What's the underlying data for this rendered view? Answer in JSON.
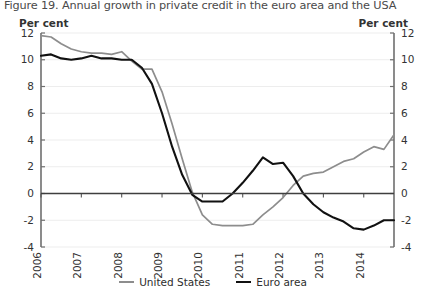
{
  "figure": {
    "title": "Figure 19. Annual growth in private credit in the euro area and the USA",
    "unit_left": "Per cent",
    "unit_right": "Per cent"
  },
  "legend": {
    "items": [
      {
        "label": "United States",
        "color": "#8d8d8d"
      },
      {
        "label": "Euro area",
        "color": "#111111"
      }
    ]
  },
  "chart_data": {
    "type": "line",
    "title": "Figure 19. Annual growth in private credit in the euro area and the USA",
    "xlabel": "",
    "ylabel": "Per cent",
    "ylabel_right": "Per cent",
    "xlim": [
      2006,
      2014.75
    ],
    "ylim": [
      -4,
      12
    ],
    "yticks": [
      -4,
      -2,
      0,
      2,
      4,
      6,
      8,
      10,
      12
    ],
    "ytick_labels": [
      "-4",
      "-2",
      "0",
      "2",
      "4",
      "6",
      "8",
      "10",
      "12"
    ],
    "xticks": [
      2006,
      2007,
      2008,
      2009,
      2010,
      2011,
      2012,
      2013,
      2014
    ],
    "xtick_labels": [
      "2006",
      "2007",
      "2008",
      "2009",
      "2010",
      "2011",
      "2012",
      "2013",
      "2014"
    ],
    "xtick_rotation": 90,
    "grid": true,
    "grid_color": "#ededed",
    "zero_line": true,
    "legend_position": "bottom-center",
    "series": [
      {
        "name": "United States",
        "color": "#8d8d8d",
        "width": 1.7,
        "x": [
          2006.0,
          2006.25,
          2006.5,
          2006.75,
          2007.0,
          2007.25,
          2007.5,
          2007.75,
          2008.0,
          2008.25,
          2008.5,
          2008.75,
          2009.0,
          2009.25,
          2009.5,
          2009.75,
          2010.0,
          2010.25,
          2010.5,
          2010.75,
          2011.0,
          2011.25,
          2011.5,
          2011.75,
          2012.0,
          2012.25,
          2012.5,
          2012.75,
          2013.0,
          2013.25,
          2013.5,
          2013.75,
          2014.0,
          2014.25,
          2014.5,
          2014.75
        ],
        "y": [
          11.8,
          11.7,
          11.2,
          10.8,
          10.6,
          10.5,
          10.5,
          10.4,
          10.6,
          9.9,
          9.3,
          9.3,
          7.6,
          5.2,
          2.6,
          0.1,
          -1.6,
          -2.3,
          -2.4,
          -2.4,
          -2.4,
          -2.3,
          -1.6,
          -1.0,
          -0.3,
          0.6,
          1.3,
          1.5,
          1.6,
          2.0,
          2.4,
          2.6,
          3.1,
          3.5,
          3.3,
          4.4
        ]
      },
      {
        "name": "Euro area",
        "color": "#111111",
        "width": 2.1,
        "x": [
          2006.0,
          2006.25,
          2006.5,
          2006.75,
          2007.0,
          2007.25,
          2007.5,
          2007.75,
          2008.0,
          2008.25,
          2008.5,
          2008.75,
          2009.0,
          2009.25,
          2009.5,
          2009.75,
          2010.0,
          2010.25,
          2010.5,
          2010.75,
          2011.0,
          2011.25,
          2011.5,
          2011.75,
          2012.0,
          2012.25,
          2012.5,
          2012.75,
          2013.0,
          2013.25,
          2013.5,
          2013.75,
          2014.0,
          2014.25,
          2014.5,
          2014.75
        ],
        "y": [
          10.3,
          10.4,
          10.1,
          10.0,
          10.1,
          10.3,
          10.1,
          10.1,
          10.0,
          10.0,
          9.4,
          8.2,
          6.0,
          3.5,
          1.4,
          -0.1,
          -0.6,
          -0.6,
          -0.6,
          0.0,
          0.8,
          1.7,
          2.7,
          2.2,
          2.3,
          1.3,
          0.0,
          -0.8,
          -1.4,
          -1.8,
          -2.1,
          -2.6,
          -2.7,
          -2.4,
          -2.0,
          -2.0
        ]
      }
    ]
  }
}
